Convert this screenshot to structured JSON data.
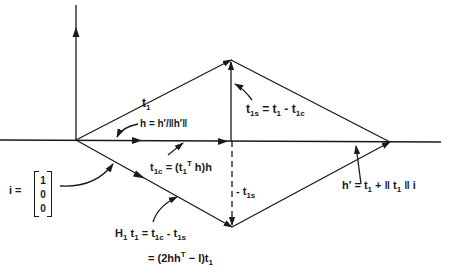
{
  "diagram": {
    "type": "vector-geometry",
    "colors": {
      "ink": "#1a1a1a",
      "background": "#ffffff"
    },
    "labels": {
      "t1": {
        "base": "t",
        "sub": "1"
      },
      "h_def": {
        "text": "h = h′/‖h′‖"
      },
      "t1s_def": {
        "base": "t",
        "sub": "1s",
        "rest_1": " = t",
        "rest_1_sub": "1",
        "rest_2": " - t",
        "rest_2_sub": "1c"
      },
      "t1c_def": {
        "base": "t",
        "sub": "1c",
        "eq": " = (t",
        "eq_sub": "1",
        "eq_sup": "T",
        "rest": " h)h"
      },
      "neg_t1s": {
        "prefix": "- t",
        "sub": "1s"
      },
      "hprime_def": {
        "base": "h′",
        "eq": " = t",
        "eq_sub": "1",
        "plus": " + ‖ t",
        "plus_sub": "1",
        "tail": " ‖ i"
      },
      "i_vector": {
        "name": "i =",
        "entries": [
          "1",
          "0",
          "0"
        ]
      },
      "H1t1_line1": {
        "H": "H",
        "H_sub": "1",
        "t": " t",
        "t_sub": "1",
        "eq": " = t",
        "eq_sub": "1c",
        "minus": " - t",
        "minus_sub": "1s"
      },
      "H1t1_line2": {
        "text_a": "= (2hh",
        "sup": "T",
        "text_b": " − I)t",
        "sub": "1"
      }
    }
  }
}
